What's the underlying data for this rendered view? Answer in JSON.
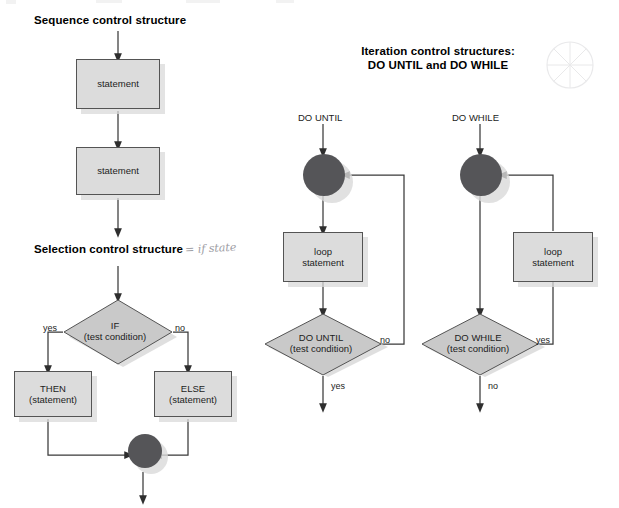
{
  "page": {
    "width": 619,
    "height": 508,
    "background": "#ffffff"
  },
  "colors": {
    "shape_fill": "#dcdcdc",
    "diamond_fill": "#c9c9c9",
    "shape_border": "#545454",
    "circle_fill": "#555558",
    "shadow": "#d9d9d9",
    "line": "#3a3a3a",
    "text": "#1c1c1c",
    "handwriting": "#8d8d94"
  },
  "headings": {
    "sequence": "Sequence control structure",
    "selection": "Selection control structure",
    "iteration_line1": "Iteration control structures:",
    "iteration_line2": "DO UNTIL and DO WHILE"
  },
  "annotations": {
    "handwritten_note": "= if state"
  },
  "sequence_structure": {
    "nodes": [
      {
        "type": "process",
        "label": "statement"
      },
      {
        "type": "process",
        "label": "statement"
      }
    ]
  },
  "selection_structure": {
    "decision": {
      "line1": "IF",
      "line2": "(test condition)"
    },
    "branch_labels": {
      "left": "yes",
      "right": "no"
    },
    "then_box": {
      "line1": "THEN",
      "line2": "(statement)"
    },
    "else_box": {
      "line1": "ELSE",
      "line2": "(statement)"
    },
    "merge": "merge-junction"
  },
  "do_until_structure": {
    "entry_label": "DO UNTIL",
    "junction": "loop-junction",
    "loop_box": {
      "line1": "loop",
      "line2": "statement"
    },
    "decision": {
      "line1": "DO UNTIL",
      "line2": "(test condition)"
    },
    "branch_labels": {
      "loop_back": "no",
      "exit": "yes"
    }
  },
  "do_while_structure": {
    "entry_label": "DO WHILE",
    "junction": "loop-junction",
    "loop_box": {
      "line1": "loop",
      "line2": "statement"
    },
    "decision": {
      "line1": "DO WHILE",
      "line2": "(test condition)"
    },
    "branch_labels": {
      "loop_back": "yes",
      "exit": "no"
    }
  }
}
